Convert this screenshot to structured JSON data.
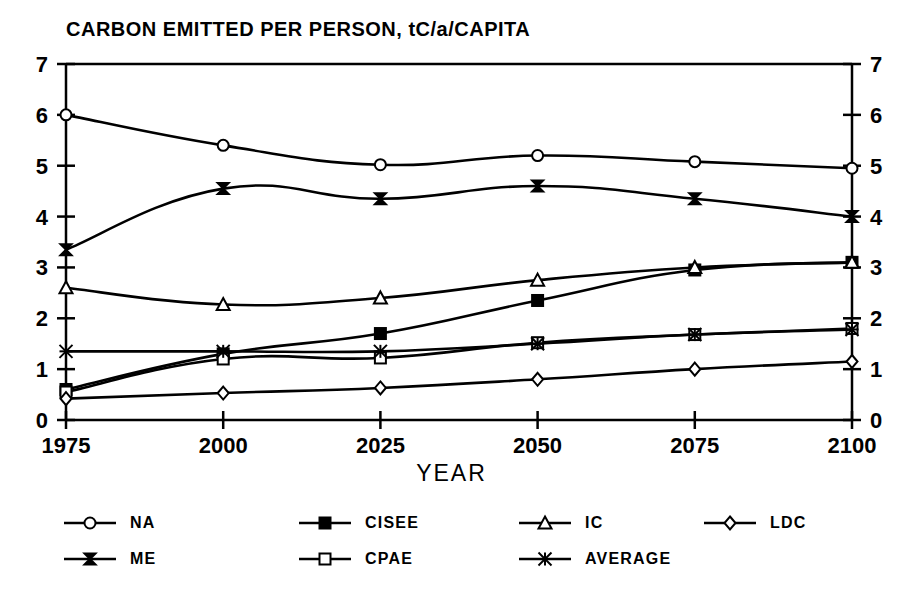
{
  "chart_data": {
    "type": "line",
    "title": "CARBON EMITTED PER PERSON, tC/a/CAPITA",
    "xlabel": "YEAR",
    "ylabel": "",
    "x": [
      1975,
      2000,
      2025,
      2050,
      2075,
      2100
    ],
    "xtick_labels": [
      "1975",
      "2000",
      "2025",
      "2050",
      "2075",
      "2100"
    ],
    "ytick_labels": [
      "0",
      "1",
      "2",
      "3",
      "4",
      "5",
      "6",
      "7"
    ],
    "ylim": [
      0,
      7
    ],
    "xlim": [
      1975,
      2100
    ],
    "grid": false,
    "legend_position": "bottom",
    "dual_y_axis": true,
    "series": [
      {
        "name": "NA",
        "marker": "circle",
        "values": [
          6.0,
          5.4,
          5.02,
          5.2,
          5.08,
          4.95
        ]
      },
      {
        "name": "ME",
        "marker": "hourglass-x",
        "values": [
          3.35,
          4.55,
          4.35,
          4.6,
          4.35,
          4.0
        ]
      },
      {
        "name": "CISEE",
        "marker": "filled-square",
        "values": [
          0.6,
          1.3,
          1.7,
          2.35,
          2.95,
          3.1
        ]
      },
      {
        "name": "CPAE",
        "marker": "open-square",
        "values": [
          0.55,
          1.2,
          1.22,
          1.52,
          1.68,
          1.8
        ]
      },
      {
        "name": "IC",
        "marker": "triangle",
        "values": [
          2.6,
          2.27,
          2.4,
          2.75,
          3.0,
          3.1
        ]
      },
      {
        "name": "AVERAGE",
        "marker": "asterisk",
        "values": [
          1.35,
          1.35,
          1.35,
          1.5,
          1.68,
          1.78
        ]
      },
      {
        "name": "LDC",
        "marker": "diamond",
        "values": [
          0.42,
          0.53,
          0.63,
          0.8,
          1.0,
          1.15
        ]
      }
    ]
  },
  "legend": {
    "rows": [
      [
        {
          "label": "NA",
          "marker": "circle"
        },
        {
          "label": "CISEE",
          "marker": "filled-square"
        },
        {
          "label": "IC",
          "marker": "triangle"
        },
        {
          "label": "LDC",
          "marker": "diamond"
        }
      ],
      [
        {
          "label": "ME",
          "marker": "hourglass-x"
        },
        {
          "label": "CPAE",
          "marker": "open-square"
        },
        {
          "label": "AVERAGE",
          "marker": "asterisk"
        }
      ]
    ]
  },
  "colors": {
    "line": "#000000",
    "axis": "#000000",
    "background": "#ffffff"
  }
}
